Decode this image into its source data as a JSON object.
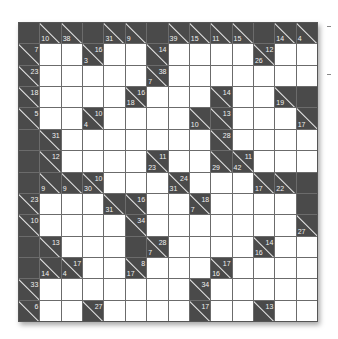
{
  "puzzle": {
    "type": "kakuro",
    "size": 14,
    "colors": {
      "block": "#4a4a4a",
      "white": "#ffffff",
      "grid_line": "#6b6b6b",
      "clue_text": "#f0f0f0"
    },
    "legend": "cell codes: B=black, W=white entry, [across,down] clue (null if none)",
    "rows": [
      [
        "B",
        [
          null,
          10
        ],
        [
          null,
          38
        ],
        "B",
        [
          null,
          31
        ],
        [
          null,
          9
        ],
        "B",
        [
          null,
          39
        ],
        [
          null,
          15
        ],
        [
          null,
          11
        ],
        [
          null,
          15
        ],
        "B",
        [
          null,
          14
        ],
        [
          null,
          4
        ]
      ],
      [
        [
          7,
          null
        ],
        "W",
        "W",
        [
          16,
          3
        ],
        "W",
        "W",
        [
          14,
          null
        ],
        "W",
        "W",
        "W",
        "W",
        [
          12,
          26
        ],
        "W",
        "W"
      ],
      [
        [
          23,
          null
        ],
        "W",
        "W",
        "W",
        "W",
        "W",
        [
          38,
          7
        ],
        "W",
        "W",
        "W",
        "W",
        "W",
        "W",
        "W"
      ],
      [
        [
          18,
          null
        ],
        "W",
        "W",
        "W",
        "W",
        [
          16,
          18
        ],
        "W",
        "W",
        "W",
        [
          14,
          null
        ],
        "W",
        "W",
        [
          null,
          19
        ],
        "B"
      ],
      [
        [
          5,
          null
        ],
        "W",
        "W",
        [
          10,
          4
        ],
        "W",
        "W",
        "W",
        "W",
        [
          null,
          10
        ],
        [
          13,
          null
        ],
        "W",
        "W",
        "W",
        [
          null,
          17
        ]
      ],
      [
        "B",
        [
          31,
          null
        ],
        "W",
        "W",
        "W",
        "W",
        "W",
        "W",
        "W",
        [
          28,
          null
        ],
        "W",
        "W",
        "W",
        "W"
      ],
      [
        "B",
        [
          12,
          null
        ],
        "W",
        "W",
        "W",
        "W",
        [
          11,
          23
        ],
        "W",
        "W",
        [
          null,
          29
        ],
        [
          11,
          42
        ],
        "W",
        "W",
        "W"
      ],
      [
        "B",
        [
          null,
          9
        ],
        [
          null,
          9
        ],
        [
          10,
          30
        ],
        "W",
        "W",
        "W",
        [
          24,
          31
        ],
        "W",
        "W",
        "W",
        [
          null,
          17
        ],
        [
          null,
          22
        ],
        "B"
      ],
      [
        [
          23,
          null
        ],
        "W",
        "W",
        "W",
        [
          null,
          31
        ],
        [
          16,
          null
        ],
        "W",
        "W",
        [
          18,
          7
        ],
        "W",
        "W",
        "W",
        "W",
        "B"
      ],
      [
        [
          10,
          null
        ],
        "W",
        "W",
        "W",
        "W",
        [
          34,
          null
        ],
        "W",
        "W",
        "W",
        "W",
        "W",
        "W",
        "W",
        [
          null,
          27
        ]
      ],
      [
        "B",
        [
          13,
          null
        ],
        "W",
        "W",
        "W",
        "B",
        [
          28,
          7
        ],
        "W",
        "W",
        "W",
        "W",
        [
          14,
          16
        ],
        "W",
        "W"
      ],
      [
        "B",
        [
          null,
          14
        ],
        [
          17,
          4
        ],
        "W",
        "W",
        [
          8,
          17
        ],
        "W",
        "W",
        "W",
        [
          17,
          16
        ],
        "W",
        "W",
        "W",
        "W"
      ],
      [
        [
          33,
          null
        ],
        "W",
        "W",
        "W",
        "W",
        "W",
        "W",
        "W",
        [
          34,
          null
        ],
        "W",
        "W",
        "W",
        "W",
        "W"
      ],
      [
        [
          6,
          null
        ],
        "W",
        "W",
        [
          27,
          null
        ],
        "W",
        "W",
        "W",
        "W",
        [
          17,
          null
        ],
        "W",
        "W",
        [
          13,
          null
        ],
        "W",
        "W"
      ]
    ]
  }
}
